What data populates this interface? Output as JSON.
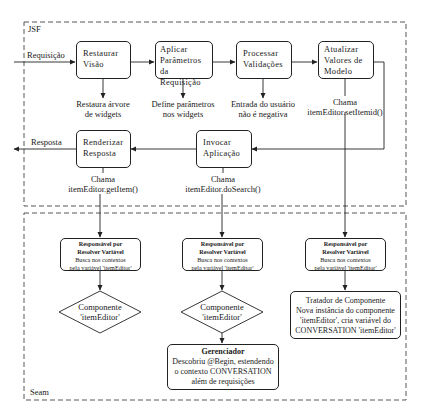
{
  "frames": {
    "jsf": {
      "label": "JSF"
    },
    "seam": {
      "label": "Seam"
    }
  },
  "flow_labels": {
    "request": "Requisição",
    "response": "Resposta"
  },
  "jsf_phases": [
    {
      "id": "restore",
      "title_l1": "Restaurar",
      "title_l2": "Visão",
      "note_l1": "Restaura árvore",
      "note_l2": "de widgets"
    },
    {
      "id": "apply",
      "title_l1": "Aplicar",
      "title_l2": "Parâmetros da",
      "title_l3": "Requisição",
      "note_l1": "Define parâmetros",
      "note_l2": "nos widgets"
    },
    {
      "id": "validate",
      "title_l1": "Processar",
      "title_l2": "Validações",
      "note_l1": "Entrada do usuário",
      "note_l2": "não é negativa"
    },
    {
      "id": "update",
      "title_l1": "Atualizar",
      "title_l2": "Valores de",
      "title_l3": "Modelo",
      "note_l1": "Chama",
      "note_l2": "itemEditor.setItemid()"
    },
    {
      "id": "invoke",
      "title_l1": "Invocar",
      "title_l2": "Aplicação",
      "note_l1": "Chama",
      "note_l2": "itemEditor.doSearch()"
    },
    {
      "id": "render",
      "title_l1": "Renderizar",
      "title_l2": "Resposta",
      "note_l1": "Chama",
      "note_l2": "itemEditor.getItem()"
    }
  ],
  "seam_resolvers": [
    {
      "title_l1": "Responsável por",
      "title_l2": "Resolver Variável",
      "body_l1": "Busca nos contextos",
      "body_l2": "pela variável 'itemEditor'"
    },
    {
      "title_l1": "Responsável por",
      "title_l2": "Resolver Variável",
      "body_l1": "Busca nos contextos",
      "body_l2": "pela variável 'itemEditor'"
    },
    {
      "title_l1": "Responsável por",
      "title_l2": "Resolver Variável",
      "body_l1": "Busca nos contextos",
      "body_l2": "pela variável 'itemEditor'"
    }
  ],
  "seam_components": [
    {
      "l1": "Componente",
      "l2": "'itemEditor'"
    },
    {
      "l1": "Componente",
      "l2": "'itemEditor'"
    }
  ],
  "manager": {
    "title": "Gerenciador",
    "l1": "Descobriu @Begin, estendendo",
    "l2": "o contexto CONVERSATION",
    "l3": "além de requisições"
  },
  "component_handler": {
    "l1": "Tratador de Componente",
    "l2": "Nova instância do componente",
    "l3": "'itemEditor', cria variável do",
    "l4": "CONVERSATION 'itemEditor'"
  },
  "colors": {
    "line": "#222222",
    "frame": "#444444",
    "background": "#ffffff"
  }
}
